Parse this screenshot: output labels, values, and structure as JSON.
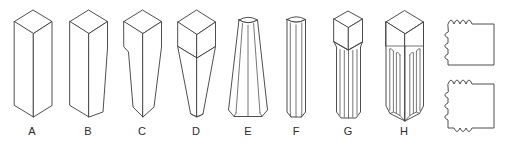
{
  "figure": {
    "type": "technical-line-drawing",
    "background_color": "#ffffff",
    "line_color": "#3b3b3b",
    "label_color": "#2b2b2b"
  },
  "shapes": [
    {
      "label": "A",
      "name": "square-prism-straight",
      "label_x": 32,
      "label_y": 133
    },
    {
      "label": "B",
      "name": "square-prism-one-side-tapered",
      "label_x": 88,
      "label_y": 133
    },
    {
      "label": "C",
      "name": "square-prism-both-sides-tapered",
      "label_x": 142,
      "label_y": 133
    },
    {
      "label": "D",
      "name": "cube-top-tapered-point",
      "label_x": 196,
      "label_y": 133
    },
    {
      "label": "E",
      "name": "fluted-tapered-column",
      "label_x": 248,
      "label_y": 133
    },
    {
      "label": "F",
      "name": "fluted-straight-column",
      "label_x": 296,
      "label_y": 133
    },
    {
      "label": "G",
      "name": "square-top-fluted-shaft",
      "label_x": 348,
      "label_y": 133
    },
    {
      "label": "H",
      "name": "deep-fluted-square-column",
      "label_x": 404,
      "label_y": 133
    }
  ],
  "cross_sections": [
    {
      "name": "cross-section-top",
      "notched_edges": [
        "top",
        "left"
      ],
      "notch_count_top": 4,
      "notch_count_left": 3
    },
    {
      "name": "cross-section-bottom",
      "notched_edges": [
        "top",
        "left",
        "bottom"
      ],
      "notch_count_top": 4,
      "notch_count_left": 3,
      "notch_count_bottom": 3
    }
  ]
}
